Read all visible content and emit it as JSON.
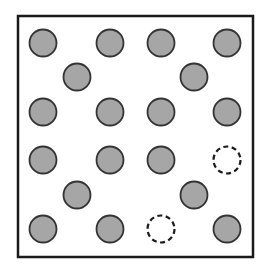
{
  "frame": {
    "x": 18,
    "y": 16,
    "width": 235,
    "height": 241,
    "stroke": "#1a1a1a",
    "stroke_width": 2.5
  },
  "circle_style": {
    "radius": 13.5,
    "filled": {
      "fill": "#a6a6a6",
      "stroke": "#333333",
      "stroke_width": 1.8
    },
    "empty": {
      "fill": "none",
      "stroke": "#1a1a1a",
      "stroke_width": 2.2,
      "dash": "5,3.5"
    }
  },
  "circles": [
    {
      "cx": 43,
      "cy": 43,
      "type": "filled"
    },
    {
      "cx": 110,
      "cy": 43,
      "type": "filled"
    },
    {
      "cx": 161,
      "cy": 43,
      "type": "filled"
    },
    {
      "cx": 227,
      "cy": 43,
      "type": "filled"
    },
    {
      "cx": 77,
      "cy": 77,
      "type": "filled"
    },
    {
      "cx": 194,
      "cy": 77,
      "type": "filled"
    },
    {
      "cx": 43,
      "cy": 112,
      "type": "filled"
    },
    {
      "cx": 110,
      "cy": 112,
      "type": "filled"
    },
    {
      "cx": 161,
      "cy": 112,
      "type": "filled"
    },
    {
      "cx": 227,
      "cy": 112,
      "type": "filled"
    },
    {
      "cx": 43,
      "cy": 160,
      "type": "filled"
    },
    {
      "cx": 110,
      "cy": 160,
      "type": "filled"
    },
    {
      "cx": 161,
      "cy": 160,
      "type": "filled"
    },
    {
      "cx": 227,
      "cy": 160,
      "type": "empty"
    },
    {
      "cx": 77,
      "cy": 195,
      "type": "filled"
    },
    {
      "cx": 194,
      "cy": 195,
      "type": "filled"
    },
    {
      "cx": 43,
      "cy": 229,
      "type": "filled"
    },
    {
      "cx": 110,
      "cy": 229,
      "type": "filled"
    },
    {
      "cx": 161,
      "cy": 229,
      "type": "empty"
    },
    {
      "cx": 227,
      "cy": 229,
      "type": "filled"
    }
  ]
}
